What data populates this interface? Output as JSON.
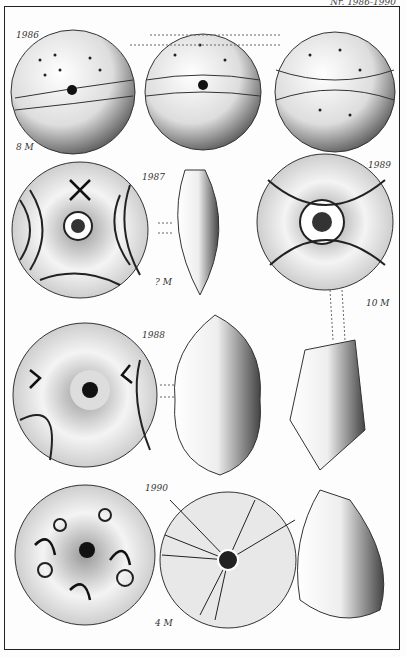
{
  "header": {
    "plate_number": "Nr. 1986-1990"
  },
  "figures": [
    {
      "number": "1986",
      "scale": "8 M",
      "views": 3,
      "description": "spherical whorl with punctate dots and incised bands"
    },
    {
      "number": "1987",
      "scale": "? M",
      "views": 2,
      "description": "disc whorl with concentric arcs and swastika"
    },
    {
      "number": "1989",
      "scale": "10 M",
      "views": 2,
      "description": "whorl with curved lines, central hole and swastika"
    },
    {
      "number": "1988",
      "scale": "",
      "views": 2,
      "description": "whorl with swastikas and dotted bands"
    },
    {
      "number": "1990",
      "scale": "4 M",
      "views": 3,
      "description": "whorl with swastikas and circles; radial-line whorl; conical profile"
    }
  ]
}
